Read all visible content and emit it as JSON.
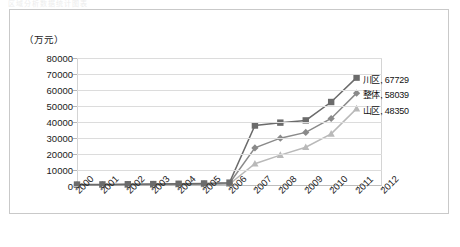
{
  "top_caption": "区域分析数据统计图表",
  "chart_frame": {
    "unit_label": "（万元）"
  },
  "chart_data": {
    "type": "line",
    "title": "",
    "subtitle": "",
    "xlabel": "",
    "ylabel": "（万元）",
    "ylim": [
      0,
      80000
    ],
    "ytick_values": [
      0,
      10000,
      20000,
      30000,
      40000,
      50000,
      60000,
      70000,
      80000
    ],
    "ytick_labels": [
      "0",
      "10000",
      "20000",
      "30000",
      "40000",
      "50000",
      "60000",
      "70000",
      "80000"
    ],
    "grid": true,
    "legend_position": "none",
    "categories": [
      "2000",
      "2001",
      "2002",
      "2003",
      "2004",
      "2005",
      "2006",
      "2007",
      "2008",
      "2009",
      "2010",
      "2011",
      "2012"
    ],
    "series": [
      {
        "name": "川区",
        "marker": "square",
        "color": "#6b6b6b",
        "values": [
          900,
          1000,
          1100,
          1200,
          1400,
          1600,
          2100,
          37800,
          39600,
          41000,
          52500,
          67729,
          null
        ],
        "end_label": "川区, 67729",
        "end_value": 67729
      },
      {
        "name": "整体",
        "marker": "diamond",
        "color": "#8a8a8a",
        "values": [
          700,
          800,
          900,
          1000,
          1100,
          1300,
          1700,
          23800,
          29900,
          33500,
          42200,
          58039,
          null
        ],
        "end_label": "整体, 58039",
        "end_value": 58039
      },
      {
        "name": "山区",
        "marker": "triangle",
        "color": "#b9b9b9",
        "values": [
          500,
          600,
          650,
          700,
          800,
          900,
          1200,
          13900,
          19300,
          24200,
          32600,
          48350,
          null
        ],
        "end_label": "山区, 48350",
        "end_value": 48350
      }
    ],
    "annotations": [
      {
        "text": "川区, 67729",
        "series": "川区",
        "at_category": "2011"
      },
      {
        "text": "整体, 58039",
        "series": "整体",
        "at_category": "2011"
      },
      {
        "text": "山区, 48350",
        "series": "山区",
        "at_category": "2011"
      }
    ]
  }
}
